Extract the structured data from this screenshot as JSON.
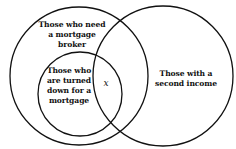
{
  "diagram": {
    "type": "venn",
    "sets": [
      {
        "id": "mortgage_broker",
        "label": "Those who need a mortgage broker"
      },
      {
        "id": "turned_down",
        "label": "Those who are turned down for a mortgage"
      },
      {
        "id": "second_income",
        "label": "Those with a second income"
      }
    ],
    "labels": {
      "broker": "Those who need a mortgage broker",
      "turned_down": "Those who are turned down for a mortgage",
      "second_income": "Those with a second income",
      "x": "x"
    },
    "stroke_color": "#111111"
  }
}
